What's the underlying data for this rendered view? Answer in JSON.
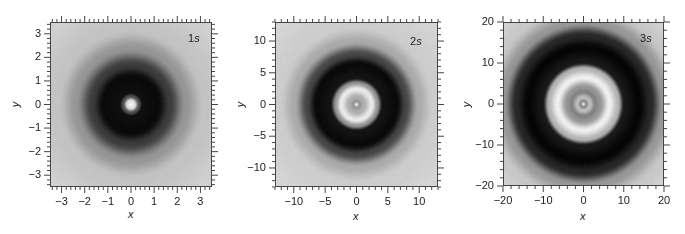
{
  "chart_data": [
    {
      "type": "heatmap",
      "title": "1s",
      "label_num": "1",
      "label_letter": "s",
      "xlabel": "x",
      "ylabel": "y",
      "xlim": [
        -3.5,
        3.5
      ],
      "ylim": [
        -3.5,
        3.5
      ],
      "xticks": [
        -3,
        -2,
        -1,
        0,
        1,
        2,
        3
      ],
      "yticks": [
        -3,
        -2,
        -1,
        0,
        1,
        2,
        3
      ],
      "xtick_labels": [
        "−3",
        "−2",
        "−1",
        "0",
        "1",
        "2",
        "3"
      ],
      "ytick_labels": [
        "−3",
        "−2",
        "−1",
        "0",
        "1",
        "2",
        "3"
      ],
      "minor_per_major": 5,
      "colormap": "grayscale",
      "description": "Radially symmetric pattern: small bright center spot (r<0.3), dark ring out to r~1.6, fading to light gray at edges",
      "radial_profile": [
        {
          "r": 0.0,
          "gray": 245
        },
        {
          "r": 0.15,
          "gray": 225
        },
        {
          "r": 0.35,
          "gray": 80
        },
        {
          "r": 0.5,
          "gray": 15
        },
        {
          "r": 1.2,
          "gray": 10
        },
        {
          "r": 1.7,
          "gray": 60
        },
        {
          "r": 2.4,
          "gray": 150
        },
        {
          "r": 3.2,
          "gray": 195
        },
        {
          "r": 5.0,
          "gray": 210
        }
      ]
    },
    {
      "type": "heatmap",
      "title": "2s",
      "label_num": "2",
      "label_letter": "s",
      "xlabel": "x",
      "ylabel": "y",
      "xlim": [
        -13,
        13
      ],
      "ylim": [
        -13,
        13
      ],
      "xticks": [
        -10,
        -5,
        0,
        5,
        10
      ],
      "yticks": [
        -10,
        -5,
        0,
        5,
        10
      ],
      "xtick_labels": [
        "−10",
        "−5",
        "0",
        "5",
        "10"
      ],
      "ytick_labels": [
        "−10",
        "−5",
        "0",
        "5",
        "10"
      ],
      "minor_per_major": 5,
      "colormap": "grayscale",
      "description": "Bright central dot, gray ring, bright ring at r~3, dark band out to r~7.5, fading to light gray at edges",
      "radial_profile": [
        {
          "r": 0.0,
          "gray": 240
        },
        {
          "r": 0.5,
          "gray": 150
        },
        {
          "r": 1.2,
          "gray": 175
        },
        {
          "r": 2.5,
          "gray": 235
        },
        {
          "r": 3.4,
          "gray": 150
        },
        {
          "r": 4.2,
          "gray": 20
        },
        {
          "r": 6.5,
          "gray": 10
        },
        {
          "r": 8.0,
          "gray": 70
        },
        {
          "r": 10.0,
          "gray": 170
        },
        {
          "r": 12.5,
          "gray": 205
        },
        {
          "r": 19.0,
          "gray": 215
        }
      ]
    },
    {
      "type": "heatmap",
      "title": "3s",
      "label_num": "3",
      "label_letter": "s",
      "xlabel": "x",
      "ylabel": "y",
      "xlim": [
        -20,
        20
      ],
      "ylim": [
        -20,
        20
      ],
      "xticks": [
        -20,
        -10,
        0,
        10,
        20
      ],
      "yticks": [
        -20,
        -10,
        0,
        10,
        20
      ],
      "xtick_labels": [
        "−20",
        "−10",
        "0",
        "10",
        "20"
      ],
      "ytick_labels": [
        "−20",
        "−10",
        "0",
        "10",
        "20"
      ],
      "minor_per_major": 5,
      "colormap": "grayscale",
      "description": "Bright central dot, gray ring, lighter ring, gray ring, bright outer ring at r~7.5, wide dark band to r~17, light gray in corners",
      "radial_profile": [
        {
          "r": 0.0,
          "gray": 235
        },
        {
          "r": 0.7,
          "gray": 140
        },
        {
          "r": 1.6,
          "gray": 190
        },
        {
          "r": 3.0,
          "gray": 130
        },
        {
          "r": 4.2,
          "gray": 150
        },
        {
          "r": 6.5,
          "gray": 240
        },
        {
          "r": 8.8,
          "gray": 180
        },
        {
          "r": 10.2,
          "gray": 25
        },
        {
          "r": 14.0,
          "gray": 5
        },
        {
          "r": 17.0,
          "gray": 40
        },
        {
          "r": 20.0,
          "gray": 150
        },
        {
          "r": 24.0,
          "gray": 200
        },
        {
          "r": 30.0,
          "gray": 215
        }
      ]
    }
  ],
  "panels": [
    {
      "title_num": "1",
      "title_letter": "s",
      "xlabel": "x",
      "ylabel": "y"
    },
    {
      "title_num": "2",
      "title_letter": "s",
      "xlabel": "x",
      "ylabel": "y"
    },
    {
      "title_num": "3",
      "title_letter": "s",
      "xlabel": "x",
      "ylabel": "y"
    }
  ]
}
